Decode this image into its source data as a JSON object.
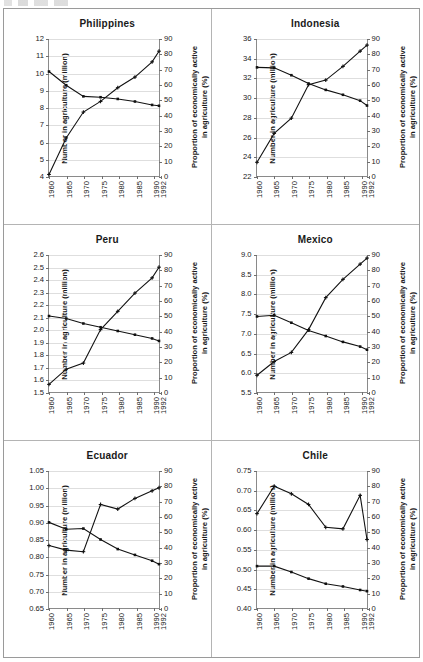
{
  "figure": {
    "axis_title_left": "Number in agriculture (million)",
    "axis_title_right_line1": "Proportion of economically active",
    "axis_title_right_line2": "in agriculture (%)",
    "x_tick_labels": [
      "1960",
      "1965",
      "1970",
      "1975",
      "1980",
      "1985",
      "1990",
      "1992"
    ],
    "right_axis_ticks": [
      "0",
      "10",
      "20",
      "30",
      "40",
      "50",
      "60",
      "70",
      "80",
      "90"
    ],
    "right_axis_range": [
      0,
      90
    ],
    "x_range": [
      1960,
      1992
    ],
    "line_color": "#111111",
    "panel_border_color": "#b4b4b4",
    "gridline_color": "#dedede"
  },
  "chart_data": [
    {
      "type": "line",
      "title": "Philippines",
      "xlabel": "",
      "ylabel": "Number in agriculture (million)",
      "y2label": "Proportion of economically active in agriculture (%)",
      "x": [
        1960,
        1965,
        1970,
        1975,
        1980,
        1985,
        1990,
        1992
      ],
      "ylim": [
        4,
        12
      ],
      "y_ticks": [
        "4",
        "5",
        "6",
        "7",
        "8",
        "9",
        "10",
        "11",
        "12"
      ],
      "y2lim": [
        0,
        90
      ],
      "series": [
        {
          "name": "Number in agriculture (million)",
          "axis": "left",
          "values": [
            10.1,
            9.3,
            8.65,
            8.6,
            8.5,
            8.35,
            8.15,
            8.1
          ]
        },
        {
          "name": "Proportion of economically active in agriculture (%)",
          "axis": "right",
          "values": [
            1,
            25,
            42,
            49,
            58,
            65,
            75,
            82
          ]
        }
      ]
    },
    {
      "type": "line",
      "title": "Indonesia",
      "xlabel": "",
      "ylabel": "Number in agriculture (million)",
      "y2label": "Proportion of economically active in agriculture (%)",
      "x": [
        1960,
        1965,
        1970,
        1975,
        1980,
        1985,
        1990,
        1992
      ],
      "ylim": [
        22,
        36
      ],
      "y_ticks": [
        "22",
        "24",
        "26",
        "28",
        "30",
        "32",
        "34",
        "36"
      ],
      "y2lim": [
        0,
        90
      ],
      "series": [
        {
          "name": "Number in agriculture (million)",
          "axis": "left",
          "values": [
            33.1,
            33.05,
            32.3,
            31.45,
            30.8,
            30.3,
            29.7,
            29.2
          ]
        },
        {
          "name": "Proportion of economically active in agriculture (%)",
          "axis": "right",
          "values": [
            9,
            28,
            38,
            60,
            63,
            72,
            82,
            86
          ]
        }
      ]
    },
    {
      "type": "line",
      "title": "Peru",
      "xlabel": "",
      "ylabel": "Number in agriculture (million)",
      "y2label": "Proportion of economically active in agriculture (%)",
      "x": [
        1960,
        1965,
        1970,
        1975,
        1980,
        1985,
        1990,
        1992
      ],
      "ylim": [
        1.5,
        2.6
      ],
      "y_ticks": [
        "1.5",
        "1.6",
        "1.7",
        "1.8",
        "1.9",
        "2.0",
        "2.1",
        "2.2",
        "2.3",
        "2.4",
        "2.5",
        "2.6"
      ],
      "y2lim": [
        0,
        90
      ],
      "series": [
        {
          "name": "Number in agriculture (million)",
          "axis": "left",
          "values": [
            2.11,
            2.09,
            2.05,
            2.02,
            1.99,
            1.96,
            1.93,
            1.91
          ]
        },
        {
          "name": "Proportion of economically active in agriculture (%)",
          "axis": "right",
          "values": [
            5,
            15,
            19,
            41,
            53,
            65,
            75,
            82
          ]
        }
      ]
    },
    {
      "type": "line",
      "title": "Mexico",
      "xlabel": "",
      "ylabel": "Number in agriculture (million)",
      "y2label": "Proportion of economically active in agriculture (%)",
      "x": [
        1960,
        1965,
        1970,
        1975,
        1980,
        1985,
        1990,
        1992
      ],
      "ylim": [
        5.5,
        9.0
      ],
      "y_ticks": [
        "5.5",
        "6.0",
        "6.5",
        "7.0",
        "7.5",
        "8.0",
        "8.5",
        "9.0"
      ],
      "y2lim": [
        0,
        90
      ],
      "series": [
        {
          "name": "Number in agriculture (million)",
          "axis": "left",
          "values": [
            7.43,
            7.46,
            7.27,
            7.07,
            6.93,
            6.78,
            6.66,
            6.58
          ]
        },
        {
          "name": "Proportion of economically active in agriculture (%)",
          "axis": "right",
          "values": [
            11,
            20,
            26,
            41,
            62,
            74,
            84,
            88
          ]
        }
      ]
    },
    {
      "type": "line",
      "title": "Ecuador",
      "xlabel": "",
      "ylabel": "Number in agriculture (million)",
      "y2label": "Proportion of economically active in agriculture (%)",
      "x": [
        1960,
        1965,
        1970,
        1975,
        1980,
        1985,
        1990,
        1992
      ],
      "ylim": [
        0.65,
        1.05
      ],
      "y_ticks": [
        "0.65",
        "0.70",
        "0.75",
        "0.80",
        "0.85",
        "0.90",
        "0.95",
        "1.00",
        "1.05"
      ],
      "y2lim": [
        0,
        90
      ],
      "series": [
        {
          "name": "Number in agriculture (million)",
          "axis": "left",
          "values": [
            0.9,
            0.88,
            0.882,
            0.85,
            0.822,
            0.805,
            0.788,
            0.778
          ]
        },
        {
          "name": "Proportion of economically active in agriculture (%)",
          "axis": "right",
          "values": [
            41,
            38,
            37,
            68,
            65,
            72,
            77,
            79
          ]
        }
      ]
    },
    {
      "type": "line",
      "title": "Chile",
      "xlabel": "",
      "ylabel": "Number in agriculture (million)",
      "y2label": "Proportion of economically active in agriculture (%)",
      "x": [
        1960,
        1965,
        1970,
        1975,
        1980,
        1985,
        1990,
        1992
      ],
      "ylim": [
        0.4,
        0.75
      ],
      "y_ticks": [
        "0.40",
        "0.45",
        "0.50",
        "0.55",
        "0.60",
        "0.65",
        "0.70",
        "0.75"
      ],
      "y2lim": [
        0,
        90
      ],
      "series": [
        {
          "name": "Number in agriculture (million)",
          "axis": "left",
          "values": [
            0.507,
            0.507,
            0.492,
            0.475,
            0.462,
            0.455,
            0.446,
            0.443
          ]
        },
        {
          "name": "Proportion of economically active in agriculture (%)",
          "axis": "right",
          "values": [
            62,
            80,
            75,
            68,
            53,
            52,
            74,
            45
          ]
        }
      ]
    }
  ]
}
